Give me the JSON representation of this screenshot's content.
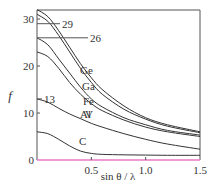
{
  "chart_data": {
    "type": "line",
    "title": "",
    "xlabel": "sin θ / λ",
    "ylabel": "f",
    "xlim": [
      0,
      1.5
    ],
    "ylim": [
      0,
      32
    ],
    "x_ticks": [
      "0.5",
      "1.0",
      "1.5"
    ],
    "y_ticks": [
      "0",
      "10",
      "20",
      "30"
    ],
    "grid": false,
    "legend": "inline labels on curves",
    "series": [
      {
        "name": "Ge",
        "x": [
          0,
          0.1,
          0.2,
          0.3,
          0.4,
          0.5,
          0.6,
          0.8,
          1.0,
          1.2,
          1.5
        ],
        "values": [
          32,
          30.5,
          27.5,
          24,
          20.5,
          17.5,
          15,
          11.5,
          9,
          7.5,
          6
        ]
      },
      {
        "name": "Ga",
        "x": [
          0,
          0.1,
          0.2,
          0.3,
          0.4,
          0.5,
          0.6,
          0.8,
          1.0,
          1.2,
          1.5
        ],
        "values": [
          31,
          29.5,
          26.5,
          23,
          19.5,
          16.5,
          14,
          10.8,
          8.7,
          7.2,
          5.8
        ]
      },
      {
        "name": "Fe",
        "x": [
          0,
          0.1,
          0.2,
          0.3,
          0.4,
          0.5,
          0.6,
          0.8,
          1.0,
          1.2,
          1.5
        ],
        "values": [
          26,
          24.5,
          21.5,
          18.5,
          15.5,
          13,
          11.3,
          9,
          7.5,
          6.3,
          5.3
        ]
      },
      {
        "name": "V",
        "x": [
          0,
          0.1,
          0.2,
          0.3,
          0.4,
          0.5,
          0.6,
          0.8,
          1.0,
          1.2,
          1.5
        ],
        "values": [
          23,
          22,
          19.5,
          16.5,
          14,
          12,
          10.5,
          8.5,
          7,
          6,
          5
        ]
      },
      {
        "name": "Al",
        "x": [
          0,
          0.1,
          0.2,
          0.3,
          0.4,
          0.5,
          0.6,
          0.8,
          1.0,
          1.2,
          1.5
        ],
        "values": [
          13,
          12.3,
          11,
          9.8,
          8.8,
          7.8,
          7,
          5.6,
          4.4,
          3.4,
          2.3
        ]
      },
      {
        "name": "C",
        "x": [
          0,
          0.1,
          0.2,
          0.3,
          0.4,
          0.5,
          0.6,
          0.8,
          1.0,
          1.2,
          1.5
        ],
        "values": [
          6,
          5.6,
          4.4,
          3,
          1.9,
          1.4,
          1.2,
          1.1,
          1.05,
          1.0,
          1.0
        ]
      }
    ],
    "reference_lines": [
      {
        "label": "29",
        "y": 29
      },
      {
        "label": "26",
        "y": 26
      },
      {
        "label": "13",
        "y": 13
      }
    ],
    "axis_colors": {
      "x_axis": "#e879c9",
      "frame": "#555555",
      "curves": "#333333"
    }
  }
}
